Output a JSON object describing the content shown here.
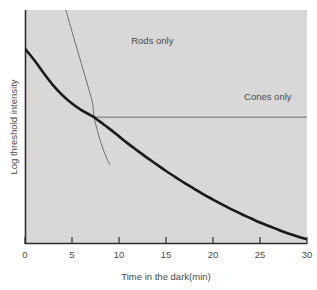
{
  "chart_data": {
    "type": "line",
    "title": "",
    "subtitle": "",
    "xlabel": "Time in the dark(min)",
    "ylabel": "Log threshold intensity",
    "xlim": [
      0,
      30
    ],
    "ylim": [
      0,
      10
    ],
    "xticks": [
      0,
      5,
      10,
      15,
      20,
      25,
      30
    ],
    "xtick_labels": [
      "0",
      "5",
      "10",
      "15",
      "20",
      "25",
      "30"
    ],
    "yticks": [],
    "ytick_labels": [],
    "grid": false,
    "legend": "none",
    "plot_background_color": "#d8d8d8",
    "page_background_color": "#ffffff",
    "series": [
      {
        "name": "Dark adaptation curve",
        "role": "combined-threshold",
        "color": "#1a1a1a",
        "line_width": 2.6,
        "points": [
          {
            "x": 0.0,
            "y": 8.35
          },
          {
            "x": 1.0,
            "y": 7.85
          },
          {
            "x": 2.0,
            "y": 7.3
          },
          {
            "x": 3.0,
            "y": 6.78
          },
          {
            "x": 4.0,
            "y": 6.35
          },
          {
            "x": 5.0,
            "y": 6.0
          },
          {
            "x": 6.0,
            "y": 5.72
          },
          {
            "x": 7.0,
            "y": 5.5
          },
          {
            "x": 7.3,
            "y": 5.43
          },
          {
            "x": 8.0,
            "y": 5.22
          },
          {
            "x": 9.0,
            "y": 4.92
          },
          {
            "x": 10.0,
            "y": 4.6
          },
          {
            "x": 11.0,
            "y": 4.28
          },
          {
            "x": 12.0,
            "y": 3.98
          },
          {
            "x": 13.0,
            "y": 3.68
          },
          {
            "x": 14.0,
            "y": 3.4
          },
          {
            "x": 15.0,
            "y": 3.12
          },
          {
            "x": 16.0,
            "y": 2.86
          },
          {
            "x": 17.0,
            "y": 2.6
          },
          {
            "x": 18.0,
            "y": 2.36
          },
          {
            "x": 19.0,
            "y": 2.12
          },
          {
            "x": 20.0,
            "y": 1.9
          },
          {
            "x": 21.0,
            "y": 1.68
          },
          {
            "x": 22.0,
            "y": 1.48
          },
          {
            "x": 23.0,
            "y": 1.28
          },
          {
            "x": 24.0,
            "y": 1.1
          },
          {
            "x": 25.0,
            "y": 0.92
          },
          {
            "x": 26.0,
            "y": 0.76
          },
          {
            "x": 27.0,
            "y": 0.6
          },
          {
            "x": 28.0,
            "y": 0.45
          },
          {
            "x": 29.0,
            "y": 0.32
          },
          {
            "x": 30.0,
            "y": 0.2
          }
        ]
      },
      {
        "name": "Rods only",
        "role": "rod-branch",
        "color": "#6f6f6f",
        "line_width": 1.0,
        "points": [
          {
            "x": 4.35,
            "y": 10.0
          },
          {
            "x": 4.8,
            "y": 9.35
          },
          {
            "x": 5.2,
            "y": 8.8
          },
          {
            "x": 5.6,
            "y": 8.25
          },
          {
            "x": 6.0,
            "y": 7.7
          },
          {
            "x": 6.4,
            "y": 7.15
          },
          {
            "x": 6.8,
            "y": 6.6
          },
          {
            "x": 7.2,
            "y": 6.0
          },
          {
            "x": 7.35,
            "y": 5.42
          },
          {
            "x": 7.7,
            "y": 4.85
          },
          {
            "x": 8.1,
            "y": 4.3
          },
          {
            "x": 8.5,
            "y": 3.85
          },
          {
            "x": 9.0,
            "y": 3.4
          }
        ]
      },
      {
        "name": "Cones only",
        "role": "cone-plateau",
        "color": "#6f6f6f",
        "line_width": 1.0,
        "points": [
          {
            "x": 7.25,
            "y": 5.42
          },
          {
            "x": 30.0,
            "y": 5.42
          }
        ]
      }
    ],
    "annotations": [
      {
        "text": "Rods only",
        "x": 11.3,
        "y": 8.55,
        "anchor": "start"
      },
      {
        "text": "Cones only",
        "x": 23.3,
        "y": 6.15,
        "anchor": "start"
      }
    ]
  }
}
